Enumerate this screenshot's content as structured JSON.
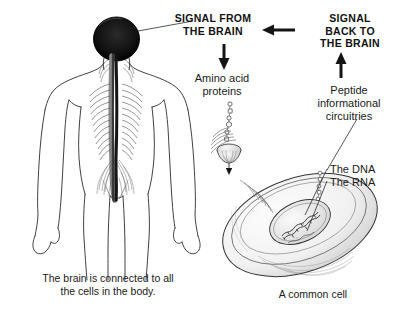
{
  "figure": {
    "background_color": "#ffffff",
    "ink_color": "#1a1a1a"
  },
  "headings": {
    "signal_from_brain": "SIGNAL FROM\nTHE BRAIN",
    "signal_from_brain_line1": "SIGNAL FROM",
    "signal_from_brain_line2": "THE BRAIN",
    "signal_back_to_brain_line1": "SIGNAL",
    "signal_back_to_brain_line2": "BACK TO",
    "signal_back_to_brain_line3": "THE BRAIN"
  },
  "labels": {
    "amino_acid_proteins_line1": "Amino acid",
    "amino_acid_proteins_line2": "proteins",
    "peptide_line1": "Peptide",
    "peptide_line2": "informational",
    "peptide_line3": "circuitries",
    "the_dna": "The DNA",
    "the_rna": "The RNA"
  },
  "captions": {
    "brain_caption_line1": "The brain is connected to all",
    "brain_caption_line2": "the cells in the body.",
    "cell_caption": "A common cell"
  },
  "arrows": [
    {
      "name": "arrow-left-signal-back",
      "direction": "left"
    },
    {
      "name": "arrow-down-to-amino",
      "direction": "down"
    },
    {
      "name": "arrow-up-from-peptide",
      "direction": "up"
    }
  ],
  "illustrations": {
    "human_figure": "human-body-with-brain-and-spinal-cord",
    "cell": "common-cell-with-nucleus-dna-rna-and-receptor"
  }
}
